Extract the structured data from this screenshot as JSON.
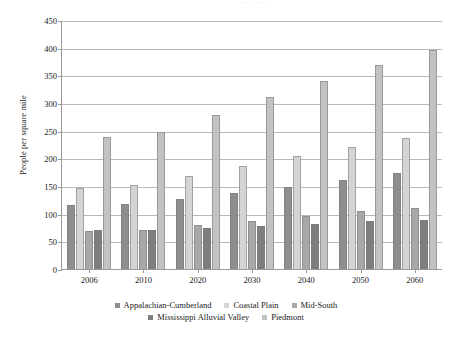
{
  "top_cropped_text": "· · ·   ·    ·   ·",
  "chart_data": {
    "type": "bar",
    "title": "",
    "subtitle": "",
    "xlabel": "",
    "ylabel": "People per square mile",
    "categories": [
      "2006",
      "2010",
      "2020",
      "2030",
      "2040",
      "2050",
      "2060"
    ],
    "ylim": [
      0,
      450
    ],
    "ytick_step": 50,
    "yticks": [
      "450",
      "400",
      "350",
      "300",
      "250",
      "200",
      "150",
      "100",
      "50",
      "0"
    ],
    "grid": "horizontal",
    "legend_position": "bottom",
    "series": [
      {
        "name": "Appalachian-Cumberland",
        "color": "#8e8e8e",
        "values": [
          115,
          118,
          127,
          138,
          149,
          160,
          173
        ]
      },
      {
        "name": "Coastal Plain",
        "color": "#d4d4d4",
        "values": [
          146,
          152,
          169,
          187,
          204,
          221,
          237
        ]
      },
      {
        "name": "Mid-South",
        "color": "#a8a8a8",
        "values": [
          68,
          70,
          79,
          87,
          96,
          104,
          111
        ]
      },
      {
        "name": "Mississippi Alluvial Valley",
        "color": "#7e7e7e",
        "values": [
          70,
          70,
          74,
          77,
          81,
          86,
          89
        ]
      },
      {
        "name": "Piedmont",
        "color": "#c2c2c2",
        "values": [
          239,
          248,
          279,
          310,
          340,
          368,
          395
        ]
      }
    ]
  }
}
